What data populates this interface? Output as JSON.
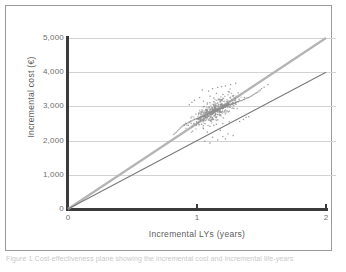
{
  "figure": {
    "caption": "Figure 1 Cost-effectiveness plane showing the incremental cost and incremental life-years"
  },
  "chart_data": {
    "type": "scatter",
    "title": "",
    "xlabel": "Incremental LYs (years)",
    "ylabel": "Incremental cost (€)",
    "xlim": [
      0,
      2
    ],
    "ylim": [
      0,
      5000
    ],
    "xticks": [
      0,
      1,
      2
    ],
    "xticklabels": [
      "0",
      "1",
      "2"
    ],
    "yticks": [
      0,
      1000,
      2000,
      3000,
      4000,
      5000
    ],
    "yticklabels": [
      "0",
      "1,000",
      "2,000",
      "3,000",
      "4,000",
      "5,000"
    ],
    "grid": "horizontal",
    "legend": "none",
    "point_color": "#8c8c8c",
    "point_count": 560,
    "cloud_center": [
      1.13,
      2880
    ],
    "cloud_x_range": [
      0.82,
      1.55
    ],
    "cloud_y_range": [
      1900,
      3720
    ],
    "reference_lines": [
      {
        "name": "upper-threshold-line",
        "slope": 2500,
        "intercept": 0,
        "color": "#b4b4b4",
        "width": 2.2,
        "label": "€2,500 per LY"
      },
      {
        "name": "lower-threshold-line",
        "slope": 2000,
        "intercept": 0,
        "color": "#7a7a7a",
        "width": 1.1,
        "label": "€2,000 per LY"
      }
    ],
    "points": [
      [
        1.13,
        2880
      ],
      [
        1.07,
        2790
      ],
      [
        1.2,
        2960
      ],
      [
        1.05,
        2700
      ],
      [
        1.18,
        3010
      ],
      [
        1.1,
        2840
      ],
      [
        1.25,
        3060
      ],
      [
        0.98,
        2620
      ],
      [
        1.15,
        2900
      ],
      [
        1.22,
        2980
      ],
      [
        1.02,
        2680
      ],
      [
        1.3,
        3120
      ],
      [
        1.08,
        2760
      ],
      [
        1.17,
        2930
      ],
      [
        0.95,
        2560
      ],
      [
        1.28,
        3080
      ],
      [
        1.12,
        2860
      ],
      [
        1.2,
        3000
      ],
      [
        1.0,
        2640
      ],
      [
        1.35,
        3180
      ],
      [
        1.06,
        2720
      ],
      [
        1.19,
        2950
      ],
      [
        0.92,
        2500
      ],
      [
        1.26,
        3040
      ],
      [
        1.14,
        2890
      ],
      [
        1.23,
        3020
      ],
      [
        1.03,
        2690
      ],
      [
        1.32,
        3140
      ],
      [
        1.09,
        2800
      ],
      [
        1.16,
        2920
      ],
      [
        0.96,
        2580
      ],
      [
        1.29,
        3100
      ],
      [
        1.11,
        2850
      ],
      [
        1.21,
        2970
      ],
      [
        1.01,
        2660
      ],
      [
        1.33,
        3160
      ],
      [
        1.04,
        2710
      ],
      [
        1.24,
        3030
      ],
      [
        0.94,
        2540
      ],
      [
        1.27,
        3070
      ],
      [
        1.13,
        2870
      ],
      [
        1.18,
        2940
      ],
      [
        0.99,
        2630
      ],
      [
        1.31,
        3130
      ],
      [
        1.07,
        2740
      ],
      [
        1.15,
        2910
      ],
      [
        0.9,
        2470
      ],
      [
        1.36,
        3200
      ],
      [
        1.1,
        2820
      ],
      [
        1.22,
        2990
      ],
      [
        1.02,
        2670
      ],
      [
        1.34,
        3170
      ],
      [
        1.05,
        2730
      ],
      [
        1.2,
        2960
      ],
      [
        0.97,
        2600
      ],
      [
        1.25,
        3050
      ],
      [
        1.12,
        2880
      ],
      [
        1.17,
        2930
      ],
      [
        1.0,
        2650
      ],
      [
        1.3,
        3110
      ],
      [
        1.08,
        2780
      ],
      [
        1.19,
        2945
      ],
      [
        0.93,
        2520
      ],
      [
        1.26,
        3060
      ],
      [
        1.14,
        2900
      ],
      [
        1.23,
        3010
      ],
      [
        1.04,
        2700
      ],
      [
        1.37,
        3210
      ],
      [
        1.06,
        2750
      ],
      [
        1.21,
        2975
      ],
      [
        0.91,
        2490
      ],
      [
        1.28,
        3090
      ],
      [
        1.11,
        2840
      ],
      [
        1.16,
        2915
      ],
      [
        1.03,
        2685
      ],
      [
        1.32,
        3150
      ],
      [
        1.09,
        2810
      ],
      [
        1.18,
        2935
      ],
      [
        0.95,
        2570
      ],
      [
        1.27,
        3065
      ],
      [
        1.45,
        3380
      ],
      [
        1.4,
        3260
      ],
      [
        0.86,
        2330
      ],
      [
        0.88,
        2400
      ],
      [
        1.48,
        3450
      ],
      [
        0.84,
        2250
      ],
      [
        1.5,
        3520
      ],
      [
        0.82,
        2180
      ],
      [
        1.42,
        3300
      ],
      [
        1.38,
        3240
      ],
      [
        1.52,
        3560
      ],
      [
        0.89,
        2430
      ],
      [
        1.44,
        3350
      ],
      [
        0.87,
        2370
      ],
      [
        1.55,
        3640
      ],
      [
        0.85,
        2290
      ],
      [
        1.41,
        3280
      ],
      [
        1.39,
        3250
      ],
      [
        1.46,
        3400
      ],
      [
        0.9,
        2450
      ],
      [
        1.43,
        3330
      ],
      [
        0.83,
        2220
      ],
      [
        1.49,
        3480
      ],
      [
        1.47,
        3420
      ],
      [
        1.13,
        3250
      ],
      [
        1.2,
        3350
      ],
      [
        1.05,
        3150
      ],
      [
        1.25,
        3420
      ],
      [
        1.1,
        3300
      ],
      [
        1.15,
        3380
      ],
      [
        1.18,
        3200
      ],
      [
        1.08,
        3100
      ],
      [
        1.13,
        2450
      ],
      [
        1.2,
        2500
      ],
      [
        1.05,
        2350
      ],
      [
        1.25,
        2550
      ],
      [
        1.1,
        2420
      ],
      [
        1.15,
        2480
      ],
      [
        1.18,
        2300
      ],
      [
        1.08,
        2250
      ],
      [
        1.12,
        3520
      ],
      [
        1.22,
        3600
      ],
      [
        1.04,
        3480
      ],
      [
        1.3,
        3680
      ],
      [
        1.16,
        3560
      ],
      [
        1.26,
        3640
      ],
      [
        1.09,
        3450
      ],
      [
        1.19,
        3580
      ],
      [
        1.12,
        2100
      ],
      [
        1.22,
        2050
      ],
      [
        1.06,
        1980
      ],
      [
        1.28,
        2150
      ],
      [
        1.16,
        2020
      ],
      [
        1.24,
        2200
      ],
      [
        1.1,
        1930
      ],
      [
        1.2,
        2120
      ],
      [
        0.98,
        3180
      ],
      [
        1.02,
        3260
      ],
      [
        0.94,
        3050
      ],
      [
        1.36,
        2620
      ],
      [
        1.4,
        2700
      ],
      [
        1.33,
        2560
      ],
      [
        0.96,
        3120
      ],
      [
        1.38,
        2680
      ],
      [
        1.13,
        2880
      ],
      [
        1.17,
        2950
      ],
      [
        1.09,
        2790
      ],
      [
        1.21,
        3020
      ],
      [
        1.06,
        2720
      ],
      [
        1.24,
        3060
      ],
      [
        1.02,
        2660
      ],
      [
        1.28,
        3100
      ],
      [
        1.14,
        2910
      ],
      [
        1.19,
        2980
      ],
      [
        1.07,
        2760
      ],
      [
        1.23,
        3030
      ],
      [
        1.04,
        2700
      ],
      [
        1.27,
        3080
      ],
      [
        1.0,
        2640
      ],
      [
        1.31,
        3140
      ]
    ]
  }
}
